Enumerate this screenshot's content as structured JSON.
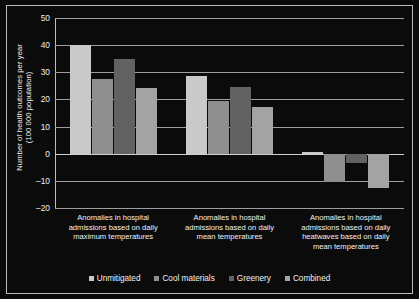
{
  "chart_data": {
    "type": "bar",
    "title": "",
    "xlabel": "",
    "ylabel": "Number of health outcomes per year\n(100 000 population)",
    "ylim": [
      -20,
      50
    ],
    "yticks": [
      50,
      40,
      30,
      20,
      10,
      0,
      -10,
      -20
    ],
    "ytick_labels": [
      "50",
      "40",
      "30",
      "20",
      "10",
      "0",
      "–10",
      "–20"
    ],
    "grid": true,
    "legend_position": "bottom",
    "categories": [
      "Anomalies in hospital\nadmissions based on daily\nmaximum temperatures",
      "Anomalies in hospital\nadmissions based on daily\nmean temperatures",
      "Anomalies in hospital\nadmissions based on daily\nheatwaves based on daily\nmean temperatures"
    ],
    "series": [
      {
        "name": "Unmitigated",
        "color": "#c9c9c9",
        "values": [
          40.0,
          28.5,
          0.7
        ]
      },
      {
        "name": "Cool materials",
        "color": "#8f8f8f",
        "values": [
          27.5,
          19.3,
          -10.3
        ]
      },
      {
        "name": "Greenery",
        "color": "#626262",
        "values": [
          34.8,
          24.6,
          -3.6
        ]
      },
      {
        "name": "Combined",
        "color": "#a3a3a3",
        "values": [
          24.3,
          17.3,
          -12.5
        ]
      }
    ]
  },
  "legend": {
    "items": [
      {
        "label": "Unmitigated"
      },
      {
        "label": "Cool materials"
      },
      {
        "label": "Greenery"
      },
      {
        "label": "Combined"
      }
    ]
  }
}
